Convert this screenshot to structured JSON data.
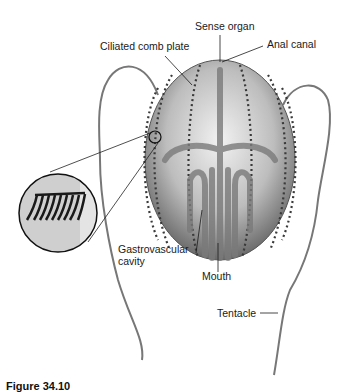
{
  "figure": {
    "caption": "Figure 34.10"
  },
  "labels": {
    "sense_organ": "Sense organ",
    "ciliated_comb_plate": "Ciliated comb plate",
    "anal_canal": "Anal canal",
    "gastrovascular_line1": "Gastrovascular",
    "gastrovascular_line2": "cavity",
    "mouth": "Mouth",
    "tentacle": "Tentacle"
  },
  "colors": {
    "background": "#ffffff",
    "body_light": "#e6e6e6",
    "body_dark": "#6a6a6a",
    "comb_rows": "#3a3a3a",
    "leader_lines": "#1a1a1a"
  }
}
